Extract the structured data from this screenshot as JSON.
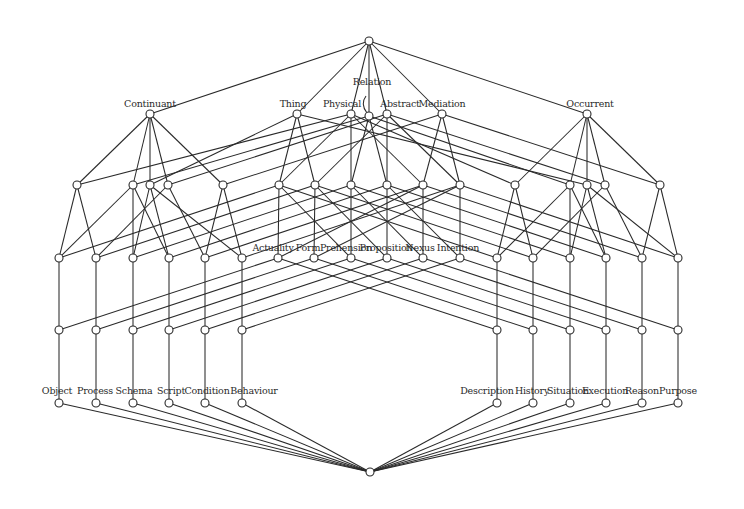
{
  "diagram": {
    "type": "lattice",
    "title": "",
    "node_radius": 4,
    "colors": {
      "line": "#2a2a2a",
      "node_fill": "#ffffff",
      "background": "#ffffff"
    },
    "nodes": [
      {
        "id": "top",
        "x": 369,
        "y": 41,
        "label": ""
      },
      {
        "id": "continuant",
        "x": 150,
        "y": 114,
        "label": "Continuant",
        "lx": 150,
        "ly": 107
      },
      {
        "id": "thing",
        "x": 297,
        "y": 114,
        "label": "Thing",
        "lx": 293,
        "ly": 107
      },
      {
        "id": "physical",
        "x": 351,
        "y": 114,
        "label": "Physical",
        "lx": 342,
        "ly": 107
      },
      {
        "id": "relation",
        "x": 369,
        "y": 116,
        "label": "Relation",
        "lx": 372,
        "ly": 85
      },
      {
        "id": "abstract",
        "x": 387,
        "y": 114,
        "label": "Abstract",
        "lx": 400,
        "ly": 107
      },
      {
        "id": "mediation",
        "x": 442,
        "y": 114,
        "label": "Mediation",
        "lx": 442,
        "ly": 107
      },
      {
        "id": "occurrent",
        "x": 587,
        "y": 114,
        "label": "Occurrent",
        "lx": 590,
        "ly": 107
      },
      {
        "id": "c1",
        "x": 77,
        "y": 185,
        "label": ""
      },
      {
        "id": "c2",
        "x": 133,
        "y": 185,
        "label": ""
      },
      {
        "id": "c3",
        "x": 150,
        "y": 185,
        "label": ""
      },
      {
        "id": "c4",
        "x": 168,
        "y": 185,
        "label": ""
      },
      {
        "id": "c5",
        "x": 223,
        "y": 185,
        "label": ""
      },
      {
        "id": "m1",
        "x": 279,
        "y": 185,
        "label": ""
      },
      {
        "id": "m2",
        "x": 315,
        "y": 185,
        "label": ""
      },
      {
        "id": "m3",
        "x": 351,
        "y": 185,
        "label": ""
      },
      {
        "id": "m4",
        "x": 387,
        "y": 185,
        "label": ""
      },
      {
        "id": "m5",
        "x": 423,
        "y": 185,
        "label": ""
      },
      {
        "id": "m6",
        "x": 460,
        "y": 185,
        "label": ""
      },
      {
        "id": "o1",
        "x": 515,
        "y": 185,
        "label": ""
      },
      {
        "id": "o2",
        "x": 570,
        "y": 185,
        "label": ""
      },
      {
        "id": "o3",
        "x": 587,
        "y": 185,
        "label": ""
      },
      {
        "id": "o4",
        "x": 605,
        "y": 185,
        "label": ""
      },
      {
        "id": "o5",
        "x": 660,
        "y": 185,
        "label": ""
      },
      {
        "id": "l1",
        "x": 59,
        "y": 258,
        "label": ""
      },
      {
        "id": "l2",
        "x": 96,
        "y": 258,
        "label": ""
      },
      {
        "id": "l3",
        "x": 133,
        "y": 258,
        "label": ""
      },
      {
        "id": "l4",
        "x": 169,
        "y": 258,
        "label": ""
      },
      {
        "id": "l5",
        "x": 205,
        "y": 258,
        "label": ""
      },
      {
        "id": "l6",
        "x": 242,
        "y": 258,
        "label": ""
      },
      {
        "id": "actuality",
        "x": 278,
        "y": 258,
        "label": "Actuality",
        "lx": 273,
        "ly": 251
      },
      {
        "id": "form",
        "x": 314,
        "y": 258,
        "label": "Form",
        "lx": 308,
        "ly": 251
      },
      {
        "id": "prehension",
        "x": 351,
        "y": 258,
        "label": "Prehension",
        "lx": 346,
        "ly": 251
      },
      {
        "id": "proposition",
        "x": 387,
        "y": 258,
        "label": "Proposition",
        "lx": 386,
        "ly": 251
      },
      {
        "id": "nexus",
        "x": 423,
        "y": 258,
        "label": "Nexus",
        "lx": 420,
        "ly": 251
      },
      {
        "id": "intention",
        "x": 460,
        "y": 258,
        "label": "Intention",
        "lx": 458,
        "ly": 251
      },
      {
        "id": "r1",
        "x": 497,
        "y": 258,
        "label": ""
      },
      {
        "id": "r2",
        "x": 533,
        "y": 258,
        "label": ""
      },
      {
        "id": "r3",
        "x": 570,
        "y": 258,
        "label": ""
      },
      {
        "id": "r4",
        "x": 606,
        "y": 258,
        "label": ""
      },
      {
        "id": "r5",
        "x": 642,
        "y": 258,
        "label": ""
      },
      {
        "id": "r6",
        "x": 678,
        "y": 258,
        "label": ""
      },
      {
        "id": "a1",
        "x": 59,
        "y": 330,
        "label": ""
      },
      {
        "id": "a2",
        "x": 96,
        "y": 330,
        "label": ""
      },
      {
        "id": "a3",
        "x": 133,
        "y": 330,
        "label": ""
      },
      {
        "id": "a4",
        "x": 169,
        "y": 330,
        "label": ""
      },
      {
        "id": "a5",
        "x": 205,
        "y": 330,
        "label": ""
      },
      {
        "id": "a6",
        "x": 242,
        "y": 330,
        "label": ""
      },
      {
        "id": "b1",
        "x": 497,
        "y": 330,
        "label": ""
      },
      {
        "id": "b2",
        "x": 533,
        "y": 330,
        "label": ""
      },
      {
        "id": "b3",
        "x": 570,
        "y": 330,
        "label": ""
      },
      {
        "id": "b4",
        "x": 606,
        "y": 330,
        "label": ""
      },
      {
        "id": "b5",
        "x": 642,
        "y": 330,
        "label": ""
      },
      {
        "id": "b6",
        "x": 678,
        "y": 330,
        "label": ""
      },
      {
        "id": "object",
        "x": 59,
        "y": 403,
        "label": "Object",
        "lx": 57,
        "ly": 394
      },
      {
        "id": "process",
        "x": 96,
        "y": 403,
        "label": "Process",
        "lx": 95,
        "ly": 394
      },
      {
        "id": "schema",
        "x": 133,
        "y": 403,
        "label": "Schema",
        "lx": 134,
        "ly": 394
      },
      {
        "id": "script",
        "x": 169,
        "y": 403,
        "label": "Script",
        "lx": 171,
        "ly": 394
      },
      {
        "id": "condition",
        "x": 205,
        "y": 403,
        "label": "Condition",
        "lx": 207,
        "ly": 394
      },
      {
        "id": "behaviour",
        "x": 242,
        "y": 403,
        "label": "Behaviour",
        "lx": 254,
        "ly": 394
      },
      {
        "id": "description",
        "x": 497,
        "y": 403,
        "label": "Description",
        "lx": 487,
        "ly": 394
      },
      {
        "id": "history",
        "x": 533,
        "y": 403,
        "label": "History",
        "lx": 532,
        "ly": 394
      },
      {
        "id": "situation",
        "x": 570,
        "y": 403,
        "label": "Situation",
        "lx": 568,
        "ly": 394
      },
      {
        "id": "execution",
        "x": 606,
        "y": 403,
        "label": "Execution",
        "lx": 605,
        "ly": 394
      },
      {
        "id": "reason",
        "x": 642,
        "y": 403,
        "label": "Reason",
        "lx": 642,
        "ly": 394
      },
      {
        "id": "purpose",
        "x": 678,
        "y": 403,
        "label": "Purpose",
        "lx": 678,
        "ly": 394
      },
      {
        "id": "bottom",
        "x": 370,
        "y": 472,
        "label": ""
      }
    ],
    "edges": [
      [
        "top",
        "continuant"
      ],
      [
        "top",
        "thing"
      ],
      [
        "top",
        "physical"
      ],
      [
        "top",
        "relation"
      ],
      [
        "top",
        "abstract"
      ],
      [
        "top",
        "mediation"
      ],
      [
        "top",
        "occurrent"
      ],
      [
        "continuant",
        "c1"
      ],
      [
        "continuant",
        "c2"
      ],
      [
        "continuant",
        "c3"
      ],
      [
        "continuant",
        "c4"
      ],
      [
        "continuant",
        "c5"
      ],
      [
        "occurrent",
        "o1"
      ],
      [
        "occurrent",
        "o2"
      ],
      [
        "occurrent",
        "o3"
      ],
      [
        "occurrent",
        "o4"
      ],
      [
        "occurrent",
        "o5"
      ],
      [
        "thing",
        "m1"
      ],
      [
        "thing",
        "m2"
      ],
      [
        "thing",
        "c3"
      ],
      [
        "thing",
        "o3"
      ],
      [
        "mediation",
        "m5"
      ],
      [
        "mediation",
        "m6"
      ],
      [
        "mediation",
        "c5"
      ],
      [
        "mediation",
        "o5"
      ],
      [
        "physical",
        "m1"
      ],
      [
        "physical",
        "m3"
      ],
      [
        "physical",
        "m5"
      ],
      [
        "physical",
        "c1"
      ],
      [
        "physical",
        "o1"
      ],
      [
        "abstract",
        "m2"
      ],
      [
        "abstract",
        "m4"
      ],
      [
        "abstract",
        "m6"
      ],
      [
        "abstract",
        "c4"
      ],
      [
        "abstract",
        "o4"
      ],
      [
        "relation",
        "m3"
      ],
      [
        "relation",
        "m4"
      ],
      [
        "relation",
        "c2"
      ],
      [
        "relation",
        "o2"
      ],
      [
        "c1",
        "l1"
      ],
      [
        "c1",
        "l2"
      ],
      [
        "c2",
        "l1"
      ],
      [
        "c2",
        "l4"
      ],
      [
        "c3",
        "l3"
      ],
      [
        "c3",
        "l6"
      ],
      [
        "c4",
        "l2"
      ],
      [
        "c4",
        "l5"
      ],
      [
        "c5",
        "l5"
      ],
      [
        "c5",
        "l6"
      ],
      [
        "c2",
        "l3"
      ],
      [
        "c3",
        "l4"
      ],
      [
        "m1",
        "actuality"
      ],
      [
        "m1",
        "prehension"
      ],
      [
        "m2",
        "form"
      ],
      [
        "m2",
        "proposition"
      ],
      [
        "m3",
        "prehension"
      ],
      [
        "m3",
        "nexus"
      ],
      [
        "m4",
        "proposition"
      ],
      [
        "m4",
        "intention"
      ],
      [
        "m5",
        "actuality"
      ],
      [
        "m5",
        "nexus"
      ],
      [
        "m6",
        "form"
      ],
      [
        "m6",
        "intention"
      ],
      [
        "o1",
        "r1"
      ],
      [
        "o1",
        "r2"
      ],
      [
        "o2",
        "r1"
      ],
      [
        "o2",
        "r4"
      ],
      [
        "o3",
        "r3"
      ],
      [
        "o3",
        "r6"
      ],
      [
        "o4",
        "r2"
      ],
      [
        "o4",
        "r5"
      ],
      [
        "o5",
        "r5"
      ],
      [
        "o5",
        "r6"
      ],
      [
        "o2",
        "r3"
      ],
      [
        "o3",
        "r4"
      ],
      [
        "m1",
        "l1"
      ],
      [
        "m2",
        "l2"
      ],
      [
        "m3",
        "l3"
      ],
      [
        "m4",
        "l4"
      ],
      [
        "m5",
        "l5"
      ],
      [
        "m6",
        "l6"
      ],
      [
        "m1",
        "r1"
      ],
      [
        "m2",
        "r2"
      ],
      [
        "m3",
        "r3"
      ],
      [
        "m4",
        "r4"
      ],
      [
        "m5",
        "r5"
      ],
      [
        "m6",
        "r6"
      ],
      [
        "l1",
        "a1"
      ],
      [
        "l2",
        "a2"
      ],
      [
        "l3",
        "a3"
      ],
      [
        "l4",
        "a4"
      ],
      [
        "l5",
        "a5"
      ],
      [
        "l6",
        "a6"
      ],
      [
        "r1",
        "b1"
      ],
      [
        "r2",
        "b2"
      ],
      [
        "r3",
        "b3"
      ],
      [
        "r4",
        "b4"
      ],
      [
        "r5",
        "b5"
      ],
      [
        "r6",
        "b6"
      ],
      [
        "actuality",
        "a1"
      ],
      [
        "form",
        "a2"
      ],
      [
        "prehension",
        "a3"
      ],
      [
        "proposition",
        "a4"
      ],
      [
        "nexus",
        "a5"
      ],
      [
        "intention",
        "a6"
      ],
      [
        "actuality",
        "b1"
      ],
      [
        "form",
        "b2"
      ],
      [
        "prehension",
        "b3"
      ],
      [
        "proposition",
        "b4"
      ],
      [
        "nexus",
        "b5"
      ],
      [
        "intention",
        "b6"
      ],
      [
        "a1",
        "object"
      ],
      [
        "a2",
        "process"
      ],
      [
        "a3",
        "schema"
      ],
      [
        "a4",
        "script"
      ],
      [
        "a5",
        "condition"
      ],
      [
        "a6",
        "behaviour"
      ],
      [
        "b1",
        "description"
      ],
      [
        "b2",
        "history"
      ],
      [
        "b3",
        "situation"
      ],
      [
        "b4",
        "execution"
      ],
      [
        "b5",
        "reason"
      ],
      [
        "b6",
        "purpose"
      ],
      [
        "object",
        "bottom"
      ],
      [
        "process",
        "bottom"
      ],
      [
        "schema",
        "bottom"
      ],
      [
        "script",
        "bottom"
      ],
      [
        "condition",
        "bottom"
      ],
      [
        "behaviour",
        "bottom"
      ],
      [
        "description",
        "bottom"
      ],
      [
        "history",
        "bottom"
      ],
      [
        "situation",
        "bottom"
      ],
      [
        "execution",
        "bottom"
      ],
      [
        "reason",
        "bottom"
      ],
      [
        "purpose",
        "bottom"
      ]
    ],
    "annotations": [
      {
        "type": "relation-curl",
        "path": "M 366 96 Q 360 104 367 113"
      }
    ]
  }
}
